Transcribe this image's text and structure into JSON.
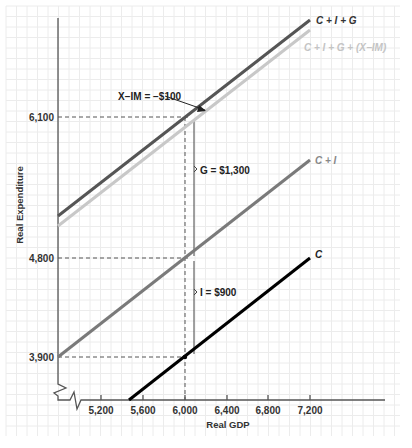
{
  "chart_data": {
    "type": "line",
    "title": "",
    "xlabel": "Real GDP",
    "ylabel": "Real Expenditure",
    "x_ticks": [
      "5,200",
      "5,600",
      "6,000",
      "6,400",
      "6,800",
      "7,200"
    ],
    "y_ticks": [
      "3,900",
      "4,800",
      "6,100"
    ],
    "grid": true,
    "axis_breaks": true,
    "series": [
      {
        "name": "C",
        "color": "#000000",
        "points": [
          [
            5500,
            3450
          ],
          [
            7200,
            4800
          ]
        ]
      },
      {
        "name": "C + I",
        "color": "#7a7a7a",
        "points": [
          [
            4800,
            3900
          ],
          [
            7200,
            5700
          ]
        ]
      },
      {
        "name": "C + I + G",
        "color": "#555555",
        "points": [
          [
            4800,
            5200
          ],
          [
            7200,
            7000
          ]
        ]
      },
      {
        "name": "C + I + G + (X−IM)",
        "color": "#c8c8c8",
        "points": [
          [
            4800,
            5100
          ],
          [
            7200,
            6900
          ]
        ]
      }
    ],
    "reference_lines": {
      "vertical_x": 6000,
      "horizontal_y": [
        6100,
        4800,
        3900
      ]
    },
    "annotations": [
      {
        "text": "X−IM = −$100"
      },
      {
        "text": "G = $1,300"
      },
      {
        "text": "I = $900"
      }
    ]
  },
  "labels": {
    "y_axis_title": "Real Expenditure",
    "x_axis_title": "Real GDP",
    "x_ticks": [
      "5,200",
      "5,600",
      "6,000",
      "6,400",
      "6,800",
      "7,200"
    ],
    "y_ticks": {
      "t6100": "6,100",
      "t4800": "4,800",
      "t3900": "3,900"
    },
    "series": {
      "c": "C",
      "ci": "C + I",
      "cig": "C + I + G",
      "cignx": "C + I + G + (X−IM)"
    },
    "annotations": {
      "nx": "X−IM = −$100",
      "g": "G = $1,300",
      "i": "I = $900"
    }
  }
}
